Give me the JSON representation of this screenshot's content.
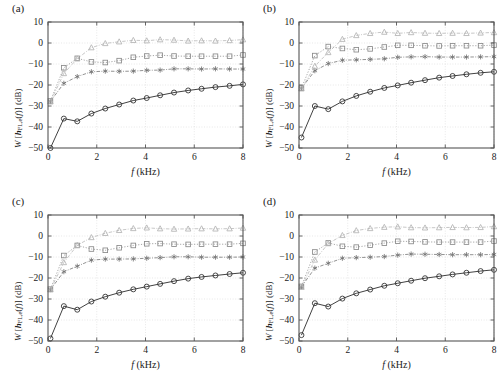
{
  "figure": {
    "panels": [
      {
        "id": "a",
        "label": "(a)",
        "xlabel_main": "f",
        "xlabel_unit": "(kHz)",
        "ylabel_parts": {
          "script": "W",
          "open": "[",
          "vector": "h",
          "subscript": "FL,e",
          "arg_open": "(",
          "arg": "f",
          "arg_close": ")",
          "close": "]",
          "unit": "(dB)"
        }
      },
      {
        "id": "b",
        "label": "(b)",
        "xlabel_main": "f",
        "xlabel_unit": "(kHz)",
        "ylabel_parts": {
          "script": "W",
          "open": "[",
          "vector": "h",
          "subscript": "FL,e",
          "arg_open": "(",
          "arg": "f",
          "arg_close": ")",
          "close": "]",
          "unit": "(dB)"
        }
      },
      {
        "id": "c",
        "label": "(c)",
        "xlabel_main": "f",
        "xlabel_unit": "(kHz)",
        "ylabel_parts": {
          "script": "W",
          "open": "[",
          "vector": "h",
          "subscript": "FL,e",
          "arg_open": "(",
          "arg": "f",
          "arg_close": ")",
          "close": "]",
          "unit": "(dB)"
        }
      },
      {
        "id": "d",
        "label": "(d)",
        "xlabel_main": "f",
        "xlabel_unit": "(kHz)",
        "ylabel_parts": {
          "script": "W",
          "open": "[",
          "vector": "h",
          "subscript": "FL,e",
          "arg_open": "(",
          "arg": "f",
          "arg_close": ")",
          "close": "]",
          "unit": "(dB)"
        }
      }
    ]
  },
  "chart_data": [
    {
      "type": "line",
      "panel": "a",
      "title": "(a)",
      "xlabel": "f (kHz)",
      "ylabel": "W [h_FL,e(f)] (dB)",
      "xlim": [
        0,
        8
      ],
      "ylim": [
        -50,
        10
      ],
      "xticks": [
        0,
        2,
        4,
        6,
        8
      ],
      "yticks": [
        -50,
        -40,
        -30,
        -20,
        -10,
        0,
        10
      ],
      "xticklabels": [
        "0",
        "2",
        "4",
        "6",
        "8"
      ],
      "yticklabels": [
        "-50",
        "-40",
        "-30",
        "-20",
        "-10",
        "0",
        "10"
      ],
      "grid": true,
      "legend": "none",
      "x": [
        0.1,
        0.65,
        1.2,
        1.78,
        2.35,
        2.92,
        3.5,
        4.05,
        4.6,
        5.17,
        5.75,
        6.3,
        6.87,
        7.45,
        8.0
      ],
      "series": [
        {
          "name": "circle-solid-black",
          "marker": "circle",
          "linestyle": "solid",
          "color": "#2b2b2b",
          "values": [
            -50.0,
            -36.0,
            -37.3,
            -33.6,
            -31.2,
            -29.3,
            -27.4,
            -26.2,
            -24.9,
            -23.6,
            -22.6,
            -21.8,
            -21.0,
            -20.4,
            -19.7
          ]
        },
        {
          "name": "star-dashdot-gray",
          "marker": "star",
          "linestyle": "dashdot",
          "color": "#6e6e6e",
          "values": [
            -27.8,
            -19.2,
            -16.0,
            -13.7,
            -13.4,
            -13.5,
            -13.4,
            -13.0,
            -12.9,
            -12.3,
            -12.3,
            -12.4,
            -12.3,
            -12.4,
            -12.4
          ]
        },
        {
          "name": "square-dotted-gray",
          "marker": "square",
          "linestyle": "dotted",
          "color": "#8a8a8a",
          "values": [
            -27.6,
            -11.8,
            -7.3,
            -9.0,
            -9.3,
            -8.4,
            -6.8,
            -6.2,
            -5.8,
            -6.2,
            -6.3,
            -6.3,
            -6.3,
            -6.3,
            -5.7
          ]
        },
        {
          "name": "triangle-dashdot-lightgray",
          "marker": "triangle",
          "linestyle": "dashdot",
          "color": "#b4b4b4",
          "values": [
            -28.0,
            -14.5,
            -7.5,
            -2.2,
            -0.2,
            0.6,
            1.3,
            1.1,
            1.6,
            1.4,
            1.0,
            1.1,
            1.0,
            1.2,
            1.6
          ]
        }
      ]
    },
    {
      "type": "line",
      "panel": "b",
      "title": "(b)",
      "xlabel": "f (kHz)",
      "ylabel": "W [h_FL,e(f)] (dB)",
      "xlim": [
        0,
        8
      ],
      "ylim": [
        -50,
        10
      ],
      "xticks": [
        0,
        2,
        4,
        6,
        8
      ],
      "yticks": [
        -50,
        -40,
        -30,
        -20,
        -10,
        0,
        10
      ],
      "xticklabels": [
        "0",
        "2",
        "4",
        "6",
        "8"
      ],
      "yticklabels": [
        "-50",
        "-40",
        "-30",
        "-20",
        "-10",
        "0",
        "10"
      ],
      "grid": true,
      "legend": "none",
      "x": [
        0.1,
        0.65,
        1.2,
        1.78,
        2.35,
        2.92,
        3.5,
        4.05,
        4.6,
        5.17,
        5.75,
        6.3,
        6.87,
        7.45,
        8.0
      ],
      "series": [
        {
          "name": "circle-solid-black",
          "marker": "circle",
          "linestyle": "solid",
          "color": "#2b2b2b",
          "values": [
            -45.0,
            -30.0,
            -31.5,
            -27.8,
            -25.2,
            -23.2,
            -21.4,
            -20.2,
            -18.9,
            -17.7,
            -16.5,
            -15.7,
            -14.9,
            -14.2,
            -13.7
          ]
        },
        {
          "name": "star-dashdot-gray",
          "marker": "star",
          "linestyle": "dashdot",
          "color": "#6e6e6e",
          "values": [
            -21.6,
            -13.2,
            -9.8,
            -8.2,
            -8.0,
            -7.8,
            -7.5,
            -6.8,
            -6.6,
            -6.5,
            -6.7,
            -6.7,
            -6.7,
            -6.6,
            -6.5
          ]
        },
        {
          "name": "square-dotted-gray",
          "marker": "square",
          "linestyle": "dotted",
          "color": "#8a8a8a",
          "values": [
            -21.5,
            -6.0,
            -1.7,
            -2.6,
            -3.2,
            -2.8,
            -1.9,
            -1.1,
            -1.1,
            -1.3,
            -1.4,
            -1.3,
            -1.3,
            -1.3,
            -1.0
          ]
        },
        {
          "name": "triangle-dashdot-lightgray",
          "marker": "triangle",
          "linestyle": "dashdot",
          "color": "#b4b4b4",
          "values": [
            -21.8,
            -11.0,
            -4.5,
            1.8,
            3.6,
            4.6,
            5.2,
            4.6,
            5.0,
            4.7,
            4.6,
            4.7,
            4.6,
            4.8,
            5.0
          ]
        }
      ]
    },
    {
      "type": "line",
      "panel": "c",
      "title": "(c)",
      "xlabel": "f (kHz)",
      "ylabel": "W [h_FL,e(f)] (dB)",
      "xlim": [
        0,
        8
      ],
      "ylim": [
        -50,
        10
      ],
      "xticks": [
        0,
        2,
        4,
        6,
        8
      ],
      "yticks": [
        -50,
        -40,
        -30,
        -20,
        -10,
        0,
        10
      ],
      "xticklabels": [
        "0",
        "2",
        "4",
        "6",
        "8"
      ],
      "yticklabels": [
        "-50",
        "-40",
        "-30",
        "-20",
        "-10",
        "0",
        "10"
      ],
      "grid": true,
      "legend": "none",
      "x": [
        0.1,
        0.65,
        1.2,
        1.78,
        2.35,
        2.92,
        3.5,
        4.05,
        4.6,
        5.17,
        5.75,
        6.3,
        6.87,
        7.45,
        8.0
      ],
      "series": [
        {
          "name": "circle-solid-black",
          "marker": "circle",
          "linestyle": "solid",
          "color": "#2b2b2b",
          "values": [
            -48.8,
            -33.4,
            -35.1,
            -31.2,
            -28.9,
            -27.0,
            -25.4,
            -24.1,
            -22.8,
            -21.5,
            -20.3,
            -19.5,
            -18.8,
            -18.1,
            -17.5
          ]
        },
        {
          "name": "star-dashdot-gray",
          "marker": "star",
          "linestyle": "dashdot",
          "color": "#6e6e6e",
          "values": [
            -25.5,
            -17.0,
            -14.4,
            -11.5,
            -11.0,
            -11.0,
            -10.9,
            -10.6,
            -10.3,
            -9.9,
            -9.9,
            -10.1,
            -10.1,
            -10.1,
            -10.0
          ]
        },
        {
          "name": "square-dotted-gray",
          "marker": "square",
          "linestyle": "dotted",
          "color": "#8a8a8a",
          "values": [
            -25.3,
            -9.3,
            -4.5,
            -6.2,
            -6.8,
            -5.6,
            -4.5,
            -3.7,
            -3.6,
            -3.9,
            -4.0,
            -3.9,
            -3.9,
            -3.9,
            -3.5
          ]
        },
        {
          "name": "triangle-dashdot-lightgray",
          "marker": "triangle",
          "linestyle": "dashdot",
          "color": "#b4b4b4",
          "values": [
            -25.6,
            -12.6,
            -4.4,
            -0.7,
            1.3,
            2.7,
            3.6,
            3.9,
            3.5,
            3.3,
            3.4,
            3.5,
            3.4,
            3.5,
            3.8
          ]
        }
      ]
    },
    {
      "type": "line",
      "panel": "d",
      "title": "(d)",
      "xlabel": "f (kHz)",
      "ylabel": "W [h_FL,e(f)] (dB)",
      "xlim": [
        0,
        8
      ],
      "ylim": [
        -50,
        10
      ],
      "xticks": [
        0,
        2,
        4,
        6,
        8
      ],
      "yticks": [
        -50,
        -40,
        -30,
        -20,
        -10,
        0,
        10
      ],
      "xticklabels": [
        "0",
        "2",
        "4",
        "6",
        "8"
      ],
      "yticklabels": [
        "-50",
        "-40",
        "-30",
        "-20",
        "-10",
        "0",
        "10"
      ],
      "grid": true,
      "legend": "none",
      "x": [
        0.1,
        0.65,
        1.2,
        1.78,
        2.35,
        2.92,
        3.5,
        4.05,
        4.6,
        5.17,
        5.75,
        6.3,
        6.87,
        7.45,
        8.0
      ],
      "series": [
        {
          "name": "circle-solid-black",
          "marker": "circle",
          "linestyle": "solid",
          "color": "#2b2b2b",
          "values": [
            -47.2,
            -32.0,
            -33.6,
            -29.8,
            -27.3,
            -25.5,
            -23.7,
            -22.5,
            -21.3,
            -20.1,
            -19.2,
            -18.3,
            -17.5,
            -16.7,
            -16.1
          ]
        },
        {
          "name": "star-dashdot-gray",
          "marker": "star",
          "linestyle": "dashdot",
          "color": "#6e6e6e",
          "values": [
            -24.2,
            -15.3,
            -13.0,
            -10.6,
            -10.3,
            -10.1,
            -9.8,
            -9.1,
            -8.6,
            -8.7,
            -8.8,
            -8.9,
            -8.9,
            -8.9,
            -8.8
          ]
        },
        {
          "name": "square-dotted-gray",
          "marker": "square",
          "linestyle": "dotted",
          "color": "#8a8a8a",
          "values": [
            -24.0,
            -7.6,
            -3.3,
            -4.9,
            -5.3,
            -4.4,
            -3.4,
            -2.5,
            -2.6,
            -2.8,
            -2.9,
            -2.9,
            -2.9,
            -2.9,
            -2.4
          ]
        },
        {
          "name": "triangle-dashdot-lightgray",
          "marker": "triangle",
          "linestyle": "dashdot",
          "color": "#b4b4b4",
          "values": [
            -24.4,
            -11.4,
            -3.6,
            0.3,
            2.6,
            3.6,
            4.2,
            4.4,
            4.0,
            3.9,
            4.0,
            4.1,
            4.0,
            4.1,
            4.5
          ]
        }
      ]
    }
  ]
}
